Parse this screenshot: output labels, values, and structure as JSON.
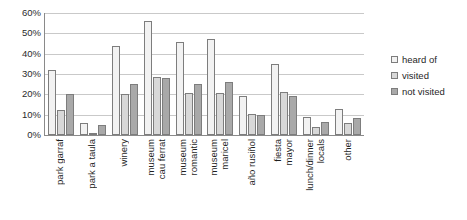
{
  "chart_data": {
    "type": "bar",
    "title": "",
    "xlabel": "",
    "ylabel": "",
    "ylim": [
      0,
      60
    ],
    "grid": true,
    "legend_position": "right",
    "ytick_labels": [
      "60%",
      "50%",
      "40%",
      "30%",
      "20%",
      "10%",
      "0%"
    ],
    "ytick_values": [
      60,
      50,
      40,
      30,
      20,
      10,
      0
    ],
    "categories": [
      "park garraf",
      "park a taula",
      "winery",
      "museum cau ferrat",
      "museum romantic",
      "museum maricel",
      "año rusiñol",
      "fiesta mayor",
      "lunch/dinner locals",
      "other"
    ],
    "category_label_lines": [
      [
        "park garraf"
      ],
      [
        "park a taula"
      ],
      [
        "winery"
      ],
      [
        "museum",
        "cau ferrat"
      ],
      [
        "museum",
        "romantic"
      ],
      [
        "museum",
        "maricel"
      ],
      [
        "año rusiñol"
      ],
      [
        "fiesta",
        "mayor"
      ],
      [
        "lunch/dinner",
        "locals"
      ],
      [
        "other"
      ]
    ],
    "series": [
      {
        "name": "heard of",
        "color": "#f2f2f2",
        "values": [
          32,
          6,
          44,
          56,
          45.5,
          47,
          19,
          35,
          9,
          13
        ]
      },
      {
        "name": "visited",
        "color": "#d8d8d8",
        "values": [
          12.5,
          1,
          20,
          28.5,
          20.5,
          20.5,
          10.5,
          21,
          4,
          6
        ]
      },
      {
        "name": "not visited",
        "color": "#a9a9a9",
        "values": [
          20,
          5,
          25,
          28,
          25,
          26,
          10,
          19,
          6.5,
          8.5
        ]
      }
    ]
  },
  "legend": {
    "items": [
      {
        "label": "heard of"
      },
      {
        "label": "visited"
      },
      {
        "label": "not visited"
      }
    ]
  }
}
